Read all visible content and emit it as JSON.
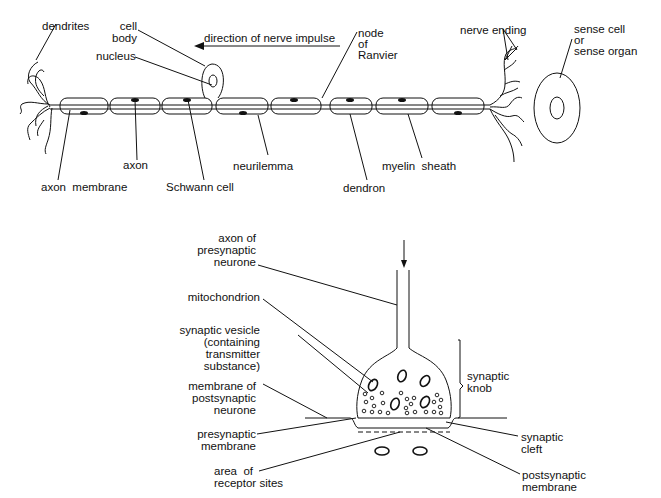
{
  "neurone": {
    "labels": {
      "dendrites": "dendrites",
      "cell_body": "cell\nbody",
      "nucleus": "nucleus",
      "direction": "direction of nerve impulse",
      "node_of_ranvier": "node\nof\nRanvier",
      "nerve_ending": "nerve ending",
      "sense_cell": "sense cell\nor\nsense organ",
      "axon": "axon",
      "neurilemma": "neurilemma",
      "axon_membrane": "axon  membrane",
      "schwann_cell": "Schwann cell",
      "myelin_sheath": "myelin  sheath",
      "dendron": "dendron"
    }
  },
  "synapse": {
    "labels": {
      "axon_presynaptic": "axon of\npresynaptic\nneurone",
      "mitochondrion": "mitochondrion",
      "synaptic_vesicle": "synaptic vesicle\n(containing\ntransmitter\nsubstance)",
      "membrane_postsynaptic_neurone": "membrane of\npostsynaptic\nneurone",
      "presynaptic_membrane": "presynaptic\nmembrane",
      "area_receptor_sites": "area  of\nreceptor sites",
      "synaptic_knob": "synaptic\nknob",
      "synaptic_cleft": "synaptic\ncleft",
      "postsynaptic_membrane": "postsynaptic\nmembrane"
    }
  }
}
